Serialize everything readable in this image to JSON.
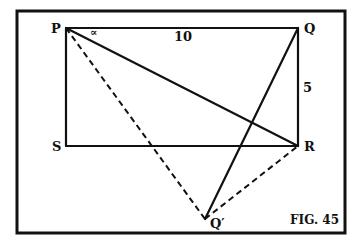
{
  "figure": {
    "caption": "FIG. 45",
    "frame": {
      "x": 17,
      "y": 11,
      "w": 328,
      "h": 222
    }
  },
  "points": {
    "P": {
      "label": "P",
      "x": 66,
      "y": 28
    },
    "Q": {
      "label": "Q",
      "x": 298,
      "y": 28
    },
    "R": {
      "label": "R",
      "x": 298,
      "y": 146
    },
    "S": {
      "label": "S",
      "x": 66,
      "y": 146
    },
    "Qp": {
      "label": "Q′",
      "x": 205,
      "y": 219
    }
  },
  "segments": {
    "solid": [
      [
        "P",
        "Q"
      ],
      [
        "Q",
        "R"
      ],
      [
        "R",
        "S"
      ],
      [
        "S",
        "P"
      ],
      [
        "P",
        "R"
      ],
      [
        "Q",
        "Qp"
      ]
    ],
    "dashed": [
      [
        "P",
        "Qp"
      ],
      [
        "Qp",
        "R"
      ]
    ]
  },
  "labels": {
    "side_PQ": "10",
    "side_QR": "5",
    "angle_P": "∝"
  }
}
